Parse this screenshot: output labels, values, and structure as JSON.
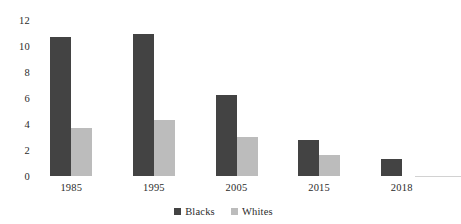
{
  "chart_data": {
    "type": "bar",
    "title": "",
    "subtitle": "",
    "xlabel": "",
    "ylabel": "",
    "categories": [
      "1985",
      "1995",
      "2005",
      "2015",
      "2018"
    ],
    "series": [
      {
        "name": "Blacks",
        "color": "#434343",
        "values": [
          10.7,
          10.9,
          6.2,
          2.8,
          1.3
        ]
      },
      {
        "name": "Whites",
        "color": "#bcbcbc",
        "values": [
          3.7,
          4.3,
          3.0,
          1.6,
          null
        ]
      }
    ],
    "ylim": [
      0,
      12
    ],
    "yticks": [
      0,
      2,
      4,
      6,
      8,
      10,
      12
    ],
    "ytick_labels": [
      "0",
      "2",
      "4",
      "6",
      "8",
      "10",
      "12"
    ],
    "grid": false,
    "legend_position": "bottom-center"
  },
  "legend": {
    "items": [
      {
        "label": "Blacks",
        "swatch": "legend-swatch-blacks"
      },
      {
        "label": "Whites",
        "swatch": "legend-swatch-whites"
      }
    ]
  },
  "colors": {
    "background": "#ffffff",
    "series_dark": "#434343",
    "series_light": "#bcbcbc",
    "text": "#2b2b2b",
    "axis_line": "#d2d2d2"
  }
}
